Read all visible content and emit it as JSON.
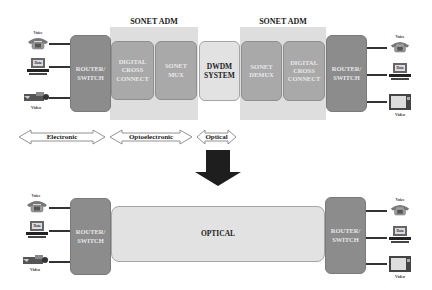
{
  "top": {
    "left_adm": {
      "title": "SONET ADM"
    },
    "right_adm": {
      "title": "SONET ADM"
    },
    "left_router": {
      "label_line1": "ROUTER/",
      "label_line2": "SWITCH"
    },
    "digital_cross_connect_left": {
      "line1": "DIGITAL",
      "line2": "CROSS",
      "line3": "CONNECT"
    },
    "sonet_mux": {
      "line1": "SONET",
      "line2": "MUX"
    },
    "dwdm": {
      "line1": "DWDM",
      "line2": "SYSTEM"
    },
    "sonet_demux": {
      "line1": "SONET",
      "line2": "DEMUX"
    },
    "digital_cross_connect_right": {
      "line1": "DIGITAL",
      "line2": "CROSS",
      "line3": "CONNECT"
    },
    "right_router": {
      "label_line1": "ROUTER/",
      "label_line2": "SWITCH"
    },
    "left_icons": [
      {
        "icon": "telephone-icon",
        "label": "Voice"
      },
      {
        "icon": "computer-icon",
        "label": "Data"
      },
      {
        "icon": "camcorder-icon",
        "label": "Video"
      }
    ],
    "right_icons": [
      {
        "icon": "telephone-icon",
        "label": "Voice"
      },
      {
        "icon": "computer-icon",
        "label": "Data"
      },
      {
        "icon": "television-icon",
        "label": "Video"
      }
    ]
  },
  "domains": [
    {
      "label": "Electronic"
    },
    {
      "label": "Optoelectronic"
    },
    {
      "label": "Optical"
    }
  ],
  "bottom": {
    "left_router": {
      "label_line1": "ROUTER/",
      "label_line2": "SWITCH"
    },
    "optical": {
      "label": "OPTICAL"
    },
    "right_router": {
      "label_line1": "ROUTER/",
      "label_line2": "SWITCH"
    },
    "left_icons": [
      {
        "icon": "telephone-icon",
        "label": "Voice"
      },
      {
        "icon": "computer-icon",
        "label": "Data"
      },
      {
        "icon": "camcorder-icon",
        "label": "Video"
      }
    ],
    "right_icons": [
      {
        "icon": "telephone-icon",
        "label": "Voice"
      },
      {
        "icon": "computer-icon",
        "label": "Data"
      },
      {
        "icon": "television-icon",
        "label": "Video"
      }
    ]
  },
  "colors": {
    "router": "#8c8c8c",
    "sonet_box": "#a9a9a9",
    "adm_background": "#dedede",
    "light_box": "#e2e2e2",
    "arrow_dark": "#222222"
  }
}
